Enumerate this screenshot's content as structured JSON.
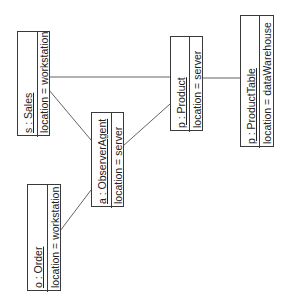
{
  "diagram": {
    "type": "UML collaboration / object diagram (rotated)",
    "objects": [
      {
        "id": "sales",
        "name": "s : Sales",
        "attribute": "location = workstation"
      },
      {
        "id": "observer",
        "name": "a : ObserverAgent",
        "attribute": "location = server"
      },
      {
        "id": "product",
        "name": "p : Product",
        "attribute": "location = server"
      },
      {
        "id": "productTable",
        "name": "p : ProductTable",
        "attribute": "location = dataWarehouse"
      },
      {
        "id": "order",
        "name": "o : Order",
        "attribute": "location = workstation"
      }
    ],
    "links": [
      {
        "from": "sales",
        "to": "product"
      },
      {
        "from": "product",
        "to": "productTable"
      },
      {
        "from": "sales",
        "to": "observer"
      },
      {
        "from": "observer",
        "to": "product"
      },
      {
        "from": "order",
        "to": "observer"
      }
    ],
    "colors": {
      "line": "#3a3a3a",
      "text": "#222222",
      "background": "#ffffff"
    }
  }
}
